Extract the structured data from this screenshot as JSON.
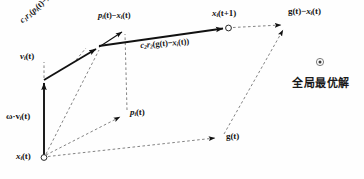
{
  "figure": {
    "width": 364,
    "height": 179,
    "background": "#fefefe",
    "line_color": "#111111",
    "dash_color": "#555555"
  },
  "labels": {
    "inertia": "ω·v",
    "inertia_sub": "i",
    "inertia_tail": "(t)",
    "velocity": "v",
    "velocity_sub": "i",
    "velocity_tail": "(t)",
    "cognitive_term": "c",
    "cognitive_full": "c1r1(pi(t)−xi(0))",
    "social_full": "c2r2(g(t)−xi(t))",
    "pbest_diff": "pi(t)−xi(t)",
    "gbest_diff": "g(t)−xi(t)",
    "x_current": "xi(t)",
    "x_next": "xi(t+1)",
    "pbest": "pi(t)",
    "gbest": "g(t)",
    "global_optimum": "全局最优解"
  },
  "label_parts": {
    "c1r1": {
      "c": "c",
      "s1": "1",
      "r": "r",
      "s2": "1",
      "open": "(",
      "p": "p",
      "s3": "i",
      "t": "(t)−",
      "x": "x",
      "s4": "i",
      "t2": "(0))"
    },
    "c2r2": {
      "c": "c",
      "s1": "2",
      "r": "r",
      "s2": "2",
      "open": "(",
      "g": "g",
      "t": "(t)−",
      "x": "x",
      "s3": "i",
      "t2": "(t))"
    },
    "pdiff": {
      "p": "p",
      "s1": "i",
      "t": "(t)−",
      "x": "x",
      "s2": "i",
      "t2": "(t)"
    },
    "gdiff": {
      "g": "g",
      "t": "(t)−",
      "x": "x",
      "s1": "i",
      "t2": "(t)"
    },
    "xnext": {
      "x": "x",
      "s1": "i",
      "t": "(t+1)"
    },
    "xcur": {
      "x": "x",
      "s1": "i",
      "t": "(t)"
    },
    "pbest": {
      "p": "p",
      "s1": "i",
      "t": "(t)"
    },
    "gbest": {
      "g": "g",
      "t": "(t)"
    },
    "omega": {
      "w": "ω·v",
      "s1": "i",
      "t": "(t)"
    },
    "vel": {
      "v": "v",
      "s1": "i",
      "t": "(t)"
    }
  },
  "points": {
    "x_current": {
      "x": 44,
      "y": 157,
      "marker": "open-circle"
    },
    "inertia_tip": {
      "x": 44,
      "y": 80,
      "marker": "solid-arrow"
    },
    "cognitive_tip": {
      "x": 100,
      "y": 47,
      "marker": "solid-arrow"
    },
    "pbest_diff_tip": {
      "x": 124,
      "y": 30,
      "marker": "solid-arrow"
    },
    "x_next": {
      "x": 228,
      "y": 28,
      "marker": "open-circle"
    },
    "gbest_diff_tip": {
      "x": 285,
      "y": 27,
      "marker": "solid-arrow"
    },
    "pbest": {
      "x": 127,
      "y": 113,
      "marker": "solid-arrow"
    },
    "gbest": {
      "x": 222,
      "y": 137,
      "marker": "solid-arrow"
    },
    "global_optimum_marker": {
      "x": 320,
      "y": 62,
      "marker": "target-dot"
    }
  },
  "vectors": [
    {
      "name": "omega-v",
      "from": "x_current",
      "to": "inertia_tip",
      "style": "solid-thick"
    },
    {
      "name": "cognitive",
      "from": "inertia_tip",
      "to": "cognitive_tip",
      "style": "solid-thick"
    },
    {
      "name": "pbest-difference",
      "from": "cognitive_tip",
      "to": "pbest_diff_tip",
      "style": "solid-thin"
    },
    {
      "name": "social",
      "from": "cognitive_tip",
      "to": "x_next",
      "style": "solid-thick"
    },
    {
      "name": "gbest-difference",
      "from": "x_next",
      "to": "gbest_diff_tip",
      "style": "dashed"
    },
    {
      "name": "pbest-from-origin",
      "from": "x_current",
      "to": "pbest",
      "style": "dashed"
    },
    {
      "name": "gbest-from-origin",
      "from": "x_current",
      "to": "gbest",
      "style": "dashed"
    },
    {
      "name": "gbest-to-corner",
      "from": "gbest",
      "to": "gbest_diff_tip",
      "style": "dashed"
    },
    {
      "name": "pbest-vertical-guide",
      "from": "pbest",
      "to": "pbest_diff_tip",
      "style": "dashed"
    },
    {
      "name": "origin-to-cognitive-guide",
      "from": "x_current",
      "to": "cognitive_tip",
      "style": "dashed"
    },
    {
      "name": "velocity-guide",
      "from": "inertia_tip",
      "to": "velocity_label",
      "style": "dashed"
    }
  ]
}
